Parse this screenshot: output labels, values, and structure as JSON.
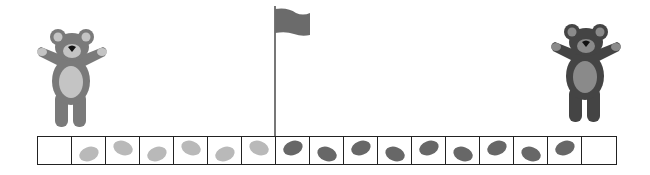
{
  "scene": {
    "description": "Two teddy bears at either end of a counting strip with a flag marker",
    "colors": {
      "background": "#ffffff",
      "strip_border": "#222222",
      "light_oval": "#b9b9b9",
      "dark_oval": "#676767",
      "flag": "#6b6b6b",
      "flag_pole": "#555555",
      "left_bear_fur": "#7a7a7a",
      "left_bear_belly": "#c4c4c4",
      "right_bear_fur": "#444444",
      "right_bear_belly": "#8a8a8a"
    }
  },
  "left_bear": {
    "icon": "teddy-bear-icon",
    "shade": "light"
  },
  "right_bear": {
    "icon": "teddy-bear-icon",
    "shade": "dark"
  },
  "flag": {
    "icon": "flag-icon",
    "position_after_cell": 7
  },
  "strip": {
    "cell_count": 17,
    "cells": [
      {
        "index": 1,
        "oval": null
      },
      {
        "index": 2,
        "oval": "light",
        "pos": "low"
      },
      {
        "index": 3,
        "oval": "light",
        "pos": "high"
      },
      {
        "index": 4,
        "oval": "light",
        "pos": "low"
      },
      {
        "index": 5,
        "oval": "light",
        "pos": "high"
      },
      {
        "index": 6,
        "oval": "light",
        "pos": "low"
      },
      {
        "index": 7,
        "oval": "light",
        "pos": "high"
      },
      {
        "index": 8,
        "oval": "dark",
        "pos": "high"
      },
      {
        "index": 9,
        "oval": "dark",
        "pos": "low"
      },
      {
        "index": 10,
        "oval": "dark",
        "pos": "high"
      },
      {
        "index": 11,
        "oval": "dark",
        "pos": "low"
      },
      {
        "index": 12,
        "oval": "dark",
        "pos": "high"
      },
      {
        "index": 13,
        "oval": "dark",
        "pos": "low"
      },
      {
        "index": 14,
        "oval": "dark",
        "pos": "high"
      },
      {
        "index": 15,
        "oval": "dark",
        "pos": "low"
      },
      {
        "index": 16,
        "oval": "dark",
        "pos": "high"
      },
      {
        "index": 17,
        "oval": null
      }
    ],
    "light_count": 6,
    "dark_count": 9
  }
}
